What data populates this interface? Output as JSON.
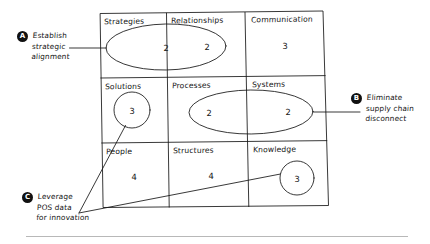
{
  "diagram": {
    "type": "matrix-3x3",
    "title": "",
    "columns": [
      "Strategies",
      "Relationships",
      "Communication"
    ],
    "rows": [
      {
        "cells": [
          {
            "label": "Strategies",
            "value": "2"
          },
          {
            "label": "Relationships",
            "value": "2"
          },
          {
            "label": "Communication",
            "value": "3"
          }
        ]
      },
      {
        "cells": [
          {
            "label": "Solutions",
            "value": "3"
          },
          {
            "label": "Processes",
            "value": "2"
          },
          {
            "label": "Systems",
            "value": "2"
          }
        ]
      },
      {
        "cells": [
          {
            "label": "People",
            "value": "4"
          },
          {
            "label": "Structures",
            "value": "4"
          },
          {
            "label": "Knowledge",
            "value": "3"
          }
        ]
      }
    ],
    "highlights": [
      {
        "shape": "ellipse",
        "covers": [
          "Strategies",
          "Relationships"
        ]
      },
      {
        "shape": "circle",
        "covers": [
          "Solutions"
        ]
      },
      {
        "shape": "ellipse",
        "covers": [
          "Processes",
          "Systems"
        ]
      },
      {
        "shape": "circle",
        "covers": [
          "Knowledge"
        ]
      }
    ]
  },
  "annotations": [
    {
      "badge": "A",
      "lines": [
        "Establish",
        "strategic",
        "alignment"
      ],
      "target": "Strategies / Relationships ellipse"
    },
    {
      "badge": "B",
      "lines": [
        "Eliminate",
        "supply chain",
        "disconnect"
      ],
      "target": "Processes / Systems ellipse"
    },
    {
      "badge": "C",
      "lines": [
        "Leverage",
        "POS data",
        "for innovation"
      ],
      "target": "Solutions circle and Knowledge circle"
    }
  ],
  "style": {
    "ink": "#151515",
    "paper": "#ffffff",
    "badge_fill": "#111111",
    "badge_text": "#ffffff",
    "rule": "#b8b8b8"
  }
}
